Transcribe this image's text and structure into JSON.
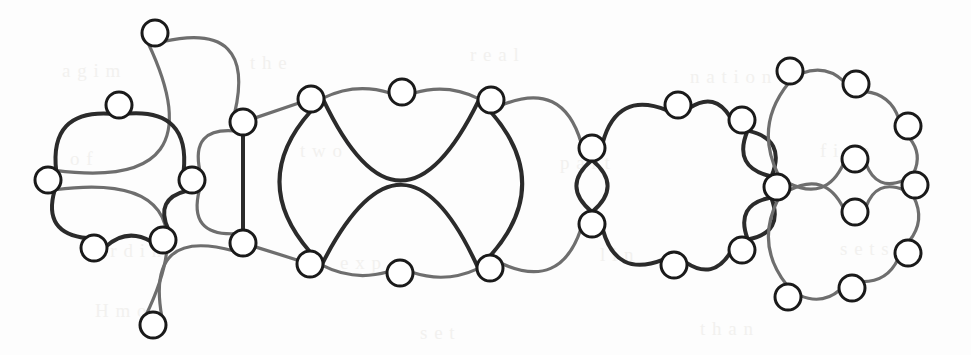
{
  "figure": {
    "background_color": "#fdfdfd",
    "node_fill": "#ffffff",
    "node_stroke": "#1a1a1a",
    "edge_color_dark": "#2b2b2b",
    "edge_color_light": "#6e6e6e",
    "node_radius": 13,
    "node_stroke_width": 3,
    "edge_width_dark": 4,
    "edge_width_light": 3.2,
    "width": 971,
    "height": 355
  },
  "graph_data": {
    "type": "node-link-diagram",
    "node_count": 40,
    "edge_count": 46,
    "nodes": [
      {
        "id": "a1",
        "label": "",
        "x": 155,
        "y": 33,
        "group": "block-1-outer"
      },
      {
        "id": "a2",
        "label": "",
        "x": 119,
        "y": 105,
        "group": "block-1-inner"
      },
      {
        "id": "a3",
        "label": "",
        "x": 48,
        "y": 180,
        "group": "block-1-inner"
      },
      {
        "id": "a4",
        "label": "",
        "x": 192,
        "y": 180,
        "group": "block-1-inner"
      },
      {
        "id": "a5",
        "label": "",
        "x": 94,
        "y": 248,
        "group": "block-1-inner"
      },
      {
        "id": "a6",
        "label": "",
        "x": 163,
        "y": 240,
        "group": "block-1-inner"
      },
      {
        "id": "a7",
        "label": "",
        "x": 153,
        "y": 325,
        "group": "block-1-outer"
      },
      {
        "id": "c1",
        "label": "",
        "x": 243,
        "y": 122,
        "group": "cut-left-top"
      },
      {
        "id": "c2",
        "label": "",
        "x": 243,
        "y": 243,
        "group": "cut-left-bottom"
      },
      {
        "id": "b1",
        "label": "",
        "x": 311,
        "y": 99,
        "group": "block-2"
      },
      {
        "id": "b2",
        "label": "",
        "x": 402,
        "y": 92,
        "group": "block-2"
      },
      {
        "id": "b3",
        "label": "",
        "x": 491,
        "y": 100,
        "group": "block-2"
      },
      {
        "id": "b4",
        "label": "",
        "x": 490,
        "y": 268,
        "group": "block-2"
      },
      {
        "id": "b5",
        "label": "",
        "x": 400,
        "y": 273,
        "group": "block-2"
      },
      {
        "id": "b6",
        "label": "",
        "x": 310,
        "y": 264,
        "group": "block-2"
      },
      {
        "id": "d1",
        "label": "",
        "x": 592,
        "y": 148,
        "group": "cut-mid-top"
      },
      {
        "id": "d2",
        "label": "",
        "x": 592,
        "y": 224,
        "group": "cut-mid-bottom"
      },
      {
        "id": "e1",
        "label": "",
        "x": 678,
        "y": 105,
        "group": "block-3"
      },
      {
        "id": "e2",
        "label": "",
        "x": 742,
        "y": 120,
        "group": "block-3"
      },
      {
        "id": "e3",
        "label": "",
        "x": 742,
        "y": 250,
        "group": "block-3"
      },
      {
        "id": "e4",
        "label": "",
        "x": 674,
        "y": 265,
        "group": "block-3"
      },
      {
        "id": "f0",
        "label": "",
        "x": 777,
        "y": 187,
        "group": "hub-right"
      },
      {
        "id": "g1",
        "label": "",
        "x": 790,
        "y": 71,
        "group": "block-4-outer"
      },
      {
        "id": "g2",
        "label": "",
        "x": 856,
        "y": 84,
        "group": "block-4-outer"
      },
      {
        "id": "g3",
        "label": "",
        "x": 908,
        "y": 126,
        "group": "block-4-outer"
      },
      {
        "id": "g4",
        "label": "",
        "x": 915,
        "y": 185,
        "group": "block-4-outer"
      },
      {
        "id": "g5",
        "label": "",
        "x": 908,
        "y": 253,
        "group": "block-4-outer"
      },
      {
        "id": "g6",
        "label": "",
        "x": 852,
        "y": 288,
        "group": "block-4-outer"
      },
      {
        "id": "g7",
        "label": "",
        "x": 788,
        "y": 297,
        "group": "block-4-outer"
      },
      {
        "id": "h1",
        "label": "",
        "x": 855,
        "y": 159,
        "group": "block-4-inner"
      },
      {
        "id": "h2",
        "label": "",
        "x": 855,
        "y": 212,
        "group": "block-4-inner"
      }
    ],
    "edges": [
      {
        "from": "a1",
        "to": "a3",
        "style": "light",
        "kind": "arc"
      },
      {
        "from": "a1",
        "to": "c1",
        "style": "light",
        "kind": "arc"
      },
      {
        "from": "a3",
        "to": "a7",
        "style": "light",
        "kind": "arc"
      },
      {
        "from": "a7",
        "to": "c2",
        "style": "light",
        "kind": "arc"
      },
      {
        "from": "a2",
        "to": "a3",
        "style": "dark",
        "kind": "arc"
      },
      {
        "from": "a2",
        "to": "a4",
        "style": "dark",
        "kind": "arc"
      },
      {
        "from": "a3",
        "to": "a5",
        "style": "dark",
        "kind": "arc"
      },
      {
        "from": "a5",
        "to": "a6",
        "style": "dark",
        "kind": "arc"
      },
      {
        "from": "a6",
        "to": "a4",
        "style": "dark",
        "kind": "arc"
      },
      {
        "from": "a4",
        "to": "c1",
        "style": "light",
        "kind": "arc"
      },
      {
        "from": "a4",
        "to": "c2",
        "style": "light",
        "kind": "arc"
      },
      {
        "from": "c1",
        "to": "c2",
        "style": "dark",
        "kind": "line"
      },
      {
        "from": "c1",
        "to": "b1",
        "style": "light",
        "kind": "line"
      },
      {
        "from": "c2",
        "to": "b6",
        "style": "light",
        "kind": "line"
      },
      {
        "from": "b1",
        "to": "b2",
        "style": "light",
        "kind": "arc"
      },
      {
        "from": "b2",
        "to": "b3",
        "style": "light",
        "kind": "arc"
      },
      {
        "from": "b1",
        "to": "b3",
        "style": "dark",
        "kind": "arc-top"
      },
      {
        "from": "b1",
        "to": "b6",
        "style": "dark",
        "kind": "arc"
      },
      {
        "from": "b3",
        "to": "b4",
        "style": "dark",
        "kind": "arc"
      },
      {
        "from": "b6",
        "to": "b5",
        "style": "light",
        "kind": "arc"
      },
      {
        "from": "b5",
        "to": "b4",
        "style": "light",
        "kind": "arc"
      },
      {
        "from": "b6",
        "to": "b4",
        "style": "dark",
        "kind": "arc-bottom"
      },
      {
        "from": "b3",
        "to": "d1",
        "style": "light",
        "kind": "arc"
      },
      {
        "from": "b4",
        "to": "d2",
        "style": "light",
        "kind": "arc"
      },
      {
        "from": "d1",
        "to": "d2",
        "style": "dark",
        "kind": "double-left"
      },
      {
        "from": "d1",
        "to": "d2",
        "style": "dark",
        "kind": "double-right"
      },
      {
        "from": "d1",
        "to": "e1",
        "style": "dark",
        "kind": "arc"
      },
      {
        "from": "e1",
        "to": "e2",
        "style": "dark",
        "kind": "arc"
      },
      {
        "from": "d2",
        "to": "e4",
        "style": "dark",
        "kind": "arc"
      },
      {
        "from": "e4",
        "to": "e3",
        "style": "dark",
        "kind": "arc"
      },
      {
        "from": "e2",
        "to": "f0",
        "style": "dark",
        "kind": "double-a"
      },
      {
        "from": "e2",
        "to": "f0",
        "style": "dark",
        "kind": "double-b"
      },
      {
        "from": "e3",
        "to": "f0",
        "style": "dark",
        "kind": "double-a"
      },
      {
        "from": "e3",
        "to": "f0",
        "style": "dark",
        "kind": "double-b"
      },
      {
        "from": "f0",
        "to": "g1",
        "style": "light",
        "kind": "arc"
      },
      {
        "from": "g1",
        "to": "g2",
        "style": "light",
        "kind": "arc"
      },
      {
        "from": "g2",
        "to": "g3",
        "style": "light",
        "kind": "arc"
      },
      {
        "from": "g3",
        "to": "g4",
        "style": "light",
        "kind": "arc"
      },
      {
        "from": "g4",
        "to": "g5",
        "style": "light",
        "kind": "arc"
      },
      {
        "from": "g5",
        "to": "g6",
        "style": "light",
        "kind": "arc"
      },
      {
        "from": "g6",
        "to": "g7",
        "style": "light",
        "kind": "arc"
      },
      {
        "from": "g7",
        "to": "f0",
        "style": "light",
        "kind": "arc"
      },
      {
        "from": "f0",
        "to": "h1",
        "style": "light",
        "kind": "arc"
      },
      {
        "from": "h1",
        "to": "g4",
        "style": "light",
        "kind": "arc"
      },
      {
        "from": "f0",
        "to": "h2",
        "style": "light",
        "kind": "arc"
      },
      {
        "from": "h2",
        "to": "g4",
        "style": "light",
        "kind": "arc"
      }
    ]
  },
  "ghost_text": [
    {
      "text": "a g i m",
      "x": 62,
      "y": 60
    },
    {
      "text": "t h e",
      "x": 250,
      "y": 52
    },
    {
      "text": "r e a l",
      "x": 470,
      "y": 44
    },
    {
      "text": "n a t i o n",
      "x": 690,
      "y": 66
    },
    {
      "text": "o f",
      "x": 70,
      "y": 148
    },
    {
      "text": "t w o",
      "x": 300,
      "y": 140
    },
    {
      "text": "p a r t",
      "x": 560,
      "y": 152
    },
    {
      "text": "f i n e",
      "x": 820,
      "y": 140
    },
    {
      "text": "c a r d i n",
      "x": 80,
      "y": 240
    },
    {
      "text": "e x p",
      "x": 340,
      "y": 252
    },
    {
      "text": "l i n",
      "x": 600,
      "y": 244
    },
    {
      "text": "s e t s",
      "x": 840,
      "y": 238
    },
    {
      "text": "H    m o",
      "x": 95,
      "y": 300
    },
    {
      "text": "s e t",
      "x": 420,
      "y": 322
    },
    {
      "text": "t h a n",
      "x": 700,
      "y": 318
    }
  ]
}
